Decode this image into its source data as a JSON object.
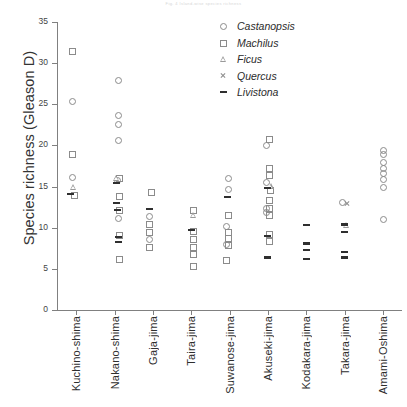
{
  "figure": {
    "faint_header": "Fig. 4 Island-wise species richness",
    "background_color": "#ffffff"
  },
  "axes": {
    "y_title": "Species richness (Gleason D)",
    "y_ticks": [
      0,
      5,
      10,
      15,
      20,
      25,
      30,
      35
    ],
    "y_min": 0,
    "y_max": 35,
    "x_categories": [
      "Kuchino-shima",
      "Nakano-shima",
      "Gaja-jima",
      "Taira-jima",
      "Suwanose-jima",
      "Akuseki-jima",
      "Kodakara-jima",
      "Takara-jima",
      "Amami-Oshima"
    ]
  },
  "legend": {
    "position": "top-right",
    "entries": [
      {
        "label": "Castanopsis",
        "marker": "open-circle",
        "color": "#8b8b8b"
      },
      {
        "label": "Machilus",
        "marker": "open-square",
        "color": "#8b8b8b"
      },
      {
        "label": "Ficus",
        "marker": "open-triangle",
        "color": "#9a9a9a"
      },
      {
        "label": "Quercus",
        "marker": "x-cross",
        "color": "#8d8d8d"
      },
      {
        "label": "Livistona",
        "marker": "dash",
        "color": "#2f2f2f"
      }
    ]
  },
  "chart_data": {
    "type": "scatter",
    "title": "",
    "xlabel": "",
    "ylabel": "Species richness (Gleason D)",
    "ylim": [
      0,
      35
    ],
    "ytick_step": 5,
    "grid": false,
    "legend_position": "top-right",
    "categories": [
      "Kuchino-shima",
      "Nakano-shima",
      "Gaja-jima",
      "Taira-jima",
      "Suwanose-jima",
      "Akuseki-jima",
      "Kodakara-jima",
      "Takara-jima",
      "Amami-Oshima"
    ],
    "series": [
      {
        "name": "Castanopsis",
        "marker": "open-circle",
        "points": [
          {
            "category": "Kuchino-shima",
            "offset": -0.1,
            "value": 25.4
          },
          {
            "category": "Kuchino-shima",
            "offset": -0.1,
            "value": 16.2
          },
          {
            "category": "Nakano-shima",
            "offset": 0.1,
            "value": 28.0
          },
          {
            "category": "Nakano-shima",
            "offset": 0.1,
            "value": 23.7
          },
          {
            "category": "Nakano-shima",
            "offset": 0.1,
            "value": 22.6
          },
          {
            "category": "Nakano-shima",
            "offset": 0.1,
            "value": 20.6
          },
          {
            "category": "Nakano-shima",
            "offset": 0.06,
            "value": 15.8
          },
          {
            "category": "Nakano-shima",
            "offset": 0.1,
            "value": 11.2
          },
          {
            "category": "Gaja-jima",
            "offset": -0.1,
            "value": 11.4
          },
          {
            "category": "Gaja-jima",
            "offset": -0.1,
            "value": 8.6
          },
          {
            "category": "Suwanose-jima",
            "offset": -0.05,
            "value": 16.1
          },
          {
            "category": "Suwanose-jima",
            "offset": -0.05,
            "value": 14.7
          },
          {
            "category": "Suwanose-jima",
            "offset": -0.1,
            "value": 10.2
          },
          {
            "category": "Suwanose-jima",
            "offset": -0.1,
            "value": 8.0
          },
          {
            "category": "Akuseki-jima",
            "offset": -0.06,
            "value": 20.1
          },
          {
            "category": "Akuseki-jima",
            "offset": -0.06,
            "value": 15.6
          },
          {
            "category": "Akuseki-jima",
            "offset": -0.06,
            "value": 12.4
          },
          {
            "category": "Akuseki-jima",
            "offset": -0.04,
            "value": 11.9
          },
          {
            "category": "Takara-jima",
            "offset": -0.06,
            "value": 13.1
          },
          {
            "category": "Amami-Oshima",
            "offset": 0.0,
            "value": 19.5
          },
          {
            "category": "Amami-Oshima",
            "offset": 0.0,
            "value": 19.0
          },
          {
            "category": "Amami-Oshima",
            "offset": 0.0,
            "value": 18.0
          },
          {
            "category": "Amami-Oshima",
            "offset": 0.0,
            "value": 17.3
          },
          {
            "category": "Amami-Oshima",
            "offset": 0.0,
            "value": 16.6
          },
          {
            "category": "Amami-Oshima",
            "offset": 0.0,
            "value": 15.9
          },
          {
            "category": "Amami-Oshima",
            "offset": 0.0,
            "value": 14.9
          },
          {
            "category": "Amami-Oshima",
            "offset": 0.0,
            "value": 11.1
          }
        ]
      },
      {
        "name": "Machilus",
        "marker": "open-square",
        "points": [
          {
            "category": "Kuchino-shima",
            "offset": -0.1,
            "value": 31.5
          },
          {
            "category": "Kuchino-shima",
            "offset": -0.1,
            "value": 19.0
          },
          {
            "category": "Kuchino-shima",
            "offset": -0.06,
            "value": 14.0
          },
          {
            "category": "Nakano-shima",
            "offset": 0.13,
            "value": 16.0
          },
          {
            "category": "Nakano-shima",
            "offset": 0.13,
            "value": 13.9
          },
          {
            "category": "Nakano-shima",
            "offset": 0.13,
            "value": 12.2
          },
          {
            "category": "Nakano-shima",
            "offset": 0.13,
            "value": 9.1
          },
          {
            "category": "Nakano-shima",
            "offset": 0.13,
            "value": 6.2
          },
          {
            "category": "Gaja-jima",
            "offset": -0.06,
            "value": 14.3
          },
          {
            "category": "Gaja-jima",
            "offset": -0.1,
            "value": 10.5
          },
          {
            "category": "Gaja-jima",
            "offset": -0.1,
            "value": 9.5
          },
          {
            "category": "Gaja-jima",
            "offset": -0.1,
            "value": 7.7
          },
          {
            "category": "Taira-jima",
            "offset": 0.06,
            "value": 12.1
          },
          {
            "category": "Taira-jima",
            "offset": 0.06,
            "value": 9.6
          },
          {
            "category": "Taira-jima",
            "offset": 0.06,
            "value": 8.6
          },
          {
            "category": "Taira-jima",
            "offset": 0.06,
            "value": 7.7
          },
          {
            "category": "Taira-jima",
            "offset": 0.06,
            "value": 6.8
          },
          {
            "category": "Taira-jima",
            "offset": 0.06,
            "value": 5.4
          },
          {
            "category": "Suwanose-jima",
            "offset": -0.04,
            "value": 11.5
          },
          {
            "category": "Suwanose-jima",
            "offset": -0.04,
            "value": 9.5
          },
          {
            "category": "Suwanose-jima",
            "offset": -0.04,
            "value": 8.7
          },
          {
            "category": "Suwanose-jima",
            "offset": -0.04,
            "value": 7.9
          },
          {
            "category": "Suwanose-jima",
            "offset": -0.08,
            "value": 6.1
          },
          {
            "category": "Akuseki-jima",
            "offset": 0.02,
            "value": 20.8
          },
          {
            "category": "Akuseki-jima",
            "offset": 0.02,
            "value": 17.3
          },
          {
            "category": "Akuseki-jima",
            "offset": 0.02,
            "value": 16.4
          },
          {
            "category": "Akuseki-jima",
            "offset": 0.06,
            "value": 14.6
          },
          {
            "category": "Akuseki-jima",
            "offset": 0.02,
            "value": 13.4
          },
          {
            "category": "Akuseki-jima",
            "offset": 0.02,
            "value": 12.4
          },
          {
            "category": "Akuseki-jima",
            "offset": 0.02,
            "value": 11.5
          },
          {
            "category": "Akuseki-jima",
            "offset": 0.02,
            "value": 9.2
          },
          {
            "category": "Akuseki-jima",
            "offset": 0.02,
            "value": 8.4
          }
        ]
      },
      {
        "name": "Ficus",
        "marker": "open-triangle",
        "points": [
          {
            "category": "Kuchino-shima",
            "offset": -0.06,
            "value": 14.9
          },
          {
            "category": "Nakano-shima",
            "offset": 0.06,
            "value": 16.1
          },
          {
            "category": "Taira-jima",
            "offset": 0.06,
            "value": 11.5
          },
          {
            "category": "Akuseki-jima",
            "offset": 0.08,
            "value": 15.1
          },
          {
            "category": "Takara-jima",
            "offset": 0.04,
            "value": 10.3
          }
        ]
      },
      {
        "name": "Quercus",
        "marker": "x-cross",
        "points": [
          {
            "category": "Takara-jima",
            "offset": 0.06,
            "value": 13.0
          }
        ]
      },
      {
        "name": "Livistona",
        "marker": "dash",
        "points": [
          {
            "category": "Kuchino-shima",
            "offset": -0.16,
            "value": 14.1
          },
          {
            "category": "Nakano-shima",
            "offset": 0.06,
            "value": 15.4
          },
          {
            "category": "Nakano-shima",
            "offset": 0.04,
            "value": 13.0
          },
          {
            "category": "Nakano-shima",
            "offset": 0.08,
            "value": 12.2
          },
          {
            "category": "Nakano-shima",
            "offset": 0.1,
            "value": 8.9
          },
          {
            "category": "Nakano-shima",
            "offset": 0.1,
            "value": 8.3
          },
          {
            "category": "Gaja-jima",
            "offset": -0.08,
            "value": 12.3
          },
          {
            "category": "Taira-jima",
            "offset": 0.02,
            "value": 9.7
          },
          {
            "category": "Suwanose-jima",
            "offset": -0.06,
            "value": 13.7
          },
          {
            "category": "Akuseki-jima",
            "offset": -0.02,
            "value": 14.8
          },
          {
            "category": "Akuseki-jima",
            "offset": -0.02,
            "value": 9.0
          },
          {
            "category": "Akuseki-jima",
            "offset": -0.02,
            "value": 6.4
          },
          {
            "category": "Kodakara-jima",
            "offset": 0.0,
            "value": 10.3
          },
          {
            "category": "Kodakara-jima",
            "offset": 0.0,
            "value": 8.1
          },
          {
            "category": "Kodakara-jima",
            "offset": 0.0,
            "value": 7.3
          },
          {
            "category": "Kodakara-jima",
            "offset": 0.0,
            "value": 6.2
          },
          {
            "category": "Takara-jima",
            "offset": 0.0,
            "value": 10.4
          },
          {
            "category": "Takara-jima",
            "offset": 0.0,
            "value": 9.5
          },
          {
            "category": "Takara-jima",
            "offset": 0.0,
            "value": 7.1
          },
          {
            "category": "Takara-jima",
            "offset": 0.0,
            "value": 6.4
          }
        ]
      }
    ]
  }
}
